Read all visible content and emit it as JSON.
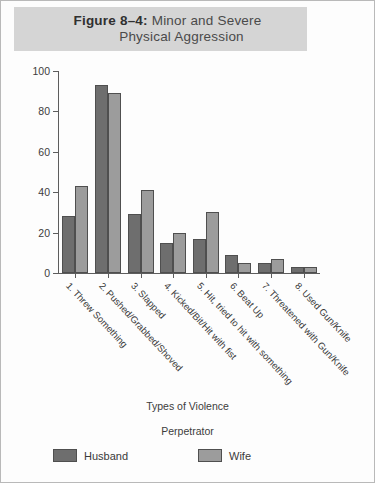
{
  "figure": {
    "number_label": "Figure 8–4:",
    "title_line1": "Minor and Severe",
    "title_line2": "Physical Aggression",
    "banner_color": "#d5d5d5"
  },
  "legend": {
    "title": "Perpetrator",
    "items": [
      {
        "label": "Husband",
        "color": "#6e6e6e"
      },
      {
        "label": "Wife",
        "color": "#9c9c9c"
      }
    ]
  },
  "chart_data": {
    "type": "bar",
    "title": "Figure 8–4: Minor and Severe Physical Aggression",
    "xlabel": "Types of Violence",
    "ylabel": "Rate per 1,000 Couples",
    "ylim": [
      0,
      100
    ],
    "yticks": [
      0,
      20,
      40,
      60,
      80,
      100
    ],
    "grid": false,
    "legend_position": "bottom",
    "legend_title": "Perpetrator",
    "categories": [
      "1. Threw Something",
      "2. Pushed/Grabbed/Shoved",
      "3. Slapped",
      "4. Kicked/Bit/Hit with fist",
      "5. Hit, tried to hit with something",
      "6. Beat Up",
      "7. Threatened with Gun/Knife",
      "8. Used Gun/Knife"
    ],
    "series": [
      {
        "name": "Husband",
        "color": "#6e6e6e",
        "values": [
          28,
          93,
          29,
          15,
          17,
          9,
          5,
          3
        ]
      },
      {
        "name": "Wife",
        "color": "#9c9c9c",
        "values": [
          43,
          89,
          41,
          20,
          30,
          5,
          7,
          3
        ]
      }
    ]
  }
}
